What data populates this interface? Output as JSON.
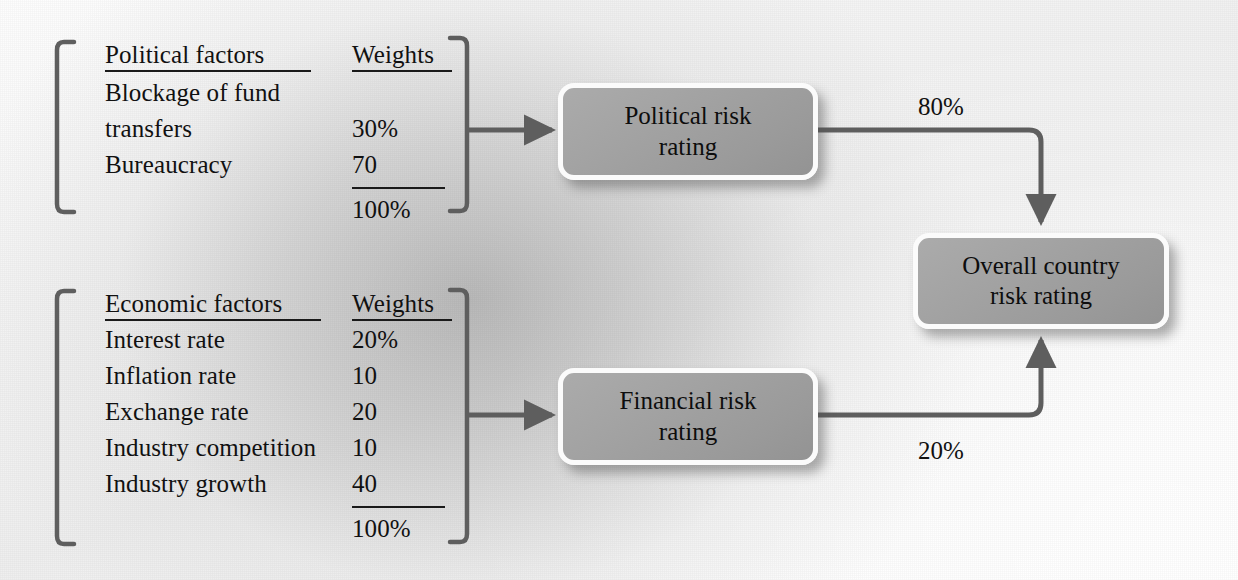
{
  "diagram": {
    "colors": {
      "box_fill": "#a2a2a2",
      "box_border": "#fbfbfb",
      "connector": "#5e5e5e",
      "bracket": "#5e5e5e",
      "text": "#111111",
      "background": "#f2f2f2"
    }
  },
  "political_group": {
    "header_factor": "Political factors",
    "header_weight": "Weights",
    "rows": [
      {
        "label": "Blockage of fund",
        "weight": ""
      },
      {
        "label": "transfers",
        "weight": "30%"
      },
      {
        "label": "Bureaucracy",
        "weight": "70"
      }
    ],
    "total_weight": "100%"
  },
  "economic_group": {
    "header_factor": "Economic factors",
    "header_weight": "Weights",
    "rows": [
      {
        "label": "Interest rate",
        "weight": "20%"
      },
      {
        "label": "Inflation rate",
        "weight": "10"
      },
      {
        "label": "Exchange rate",
        "weight": "20"
      },
      {
        "label": "Industry competition",
        "weight": "10"
      },
      {
        "label": "Industry growth",
        "weight": "40"
      }
    ],
    "total_weight": "100%"
  },
  "nodes": {
    "political_risk": "Political risk\nrating",
    "political_risk_line1": "Political risk",
    "political_risk_line2": "rating",
    "financial_risk_line1": "Financial risk",
    "financial_risk_line2": "rating",
    "overall_risk_line1": "Overall country",
    "overall_risk_line2": "risk rating"
  },
  "edges": {
    "political_weight_label": "80%",
    "financial_weight_label": "20%"
  }
}
